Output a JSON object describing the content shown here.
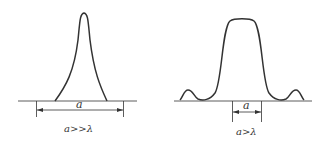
{
  "figures": [
    {
      "id": "left",
      "dimension_label": "a",
      "caption": "a>>λ",
      "description": "narrow single sharp peak"
    },
    {
      "id": "right",
      "dimension_label": "a",
      "caption": "a>λ",
      "description": "broad central peak with small side lobes"
    }
  ],
  "colors": {
    "stroke": "#333333",
    "background": "#ffffff"
  }
}
